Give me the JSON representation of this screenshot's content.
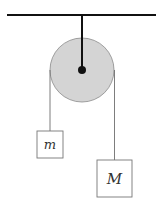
{
  "diagram": {
    "type": "atwood-machine",
    "colors": {
      "background": "#ffffff",
      "ceiling": "#111111",
      "rod": "#111111",
      "pulley_fill": "#d4d4d4",
      "pulley_stroke": "#8a8a8a",
      "axle": "#111111",
      "rope": "#6e6e6e",
      "block_stroke": "#777777",
      "block_fill": "#ffffff",
      "label": "#333333"
    },
    "ceiling": {
      "x1": 7,
      "x2": 156,
      "y": 15
    },
    "pulley": {
      "cx": 82,
      "cy": 70,
      "r": 32,
      "axle_r": 4
    },
    "blocks": [
      {
        "id": "small",
        "label": "m",
        "x": 37,
        "y": 131,
        "w": 26,
        "h": 27,
        "rope_x": 50
      },
      {
        "id": "large",
        "label": "M",
        "x": 97,
        "y": 160,
        "w": 35,
        "h": 37,
        "rope_x": 114.5
      }
    ]
  }
}
